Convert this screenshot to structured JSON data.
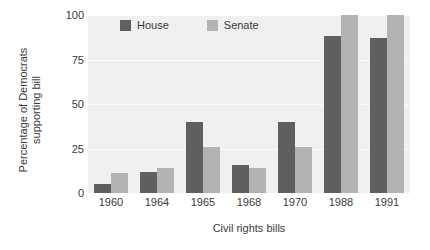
{
  "chart_data": {
    "type": "bar",
    "title": "",
    "xlabel": "Civil rights bills",
    "ylabel": "Percentage of Democrats supporting bill",
    "categories": [
      "1960",
      "1964",
      "1965",
      "1968",
      "1970",
      "1988",
      "1991"
    ],
    "series": [
      {
        "name": "House",
        "color": "#5f5f5f",
        "values": [
          5,
          12,
          40,
          16,
          40,
          88,
          87
        ]
      },
      {
        "name": "Senate",
        "color": "#b3b3b3",
        "values": [
          11,
          14,
          26,
          14,
          26,
          100,
          100
        ]
      }
    ],
    "ylim": [
      0,
      100
    ],
    "yticks": [
      "0",
      "25",
      "50",
      "75",
      "100"
    ],
    "ytick_values": [
      0,
      25,
      50,
      75,
      100
    ],
    "grid": true,
    "legend_position": "top-left-inside",
    "plot_background": "#f0f0f0",
    "gridline_color": "#fbfbfb"
  },
  "legend": {
    "items": [
      {
        "label": "House"
      },
      {
        "label": "Senate"
      }
    ]
  }
}
